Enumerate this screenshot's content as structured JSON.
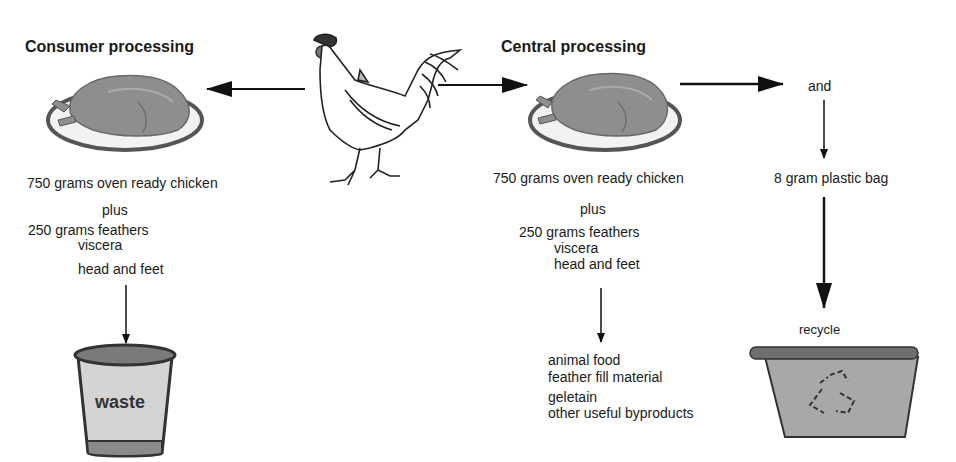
{
  "diagram": {
    "consumer": {
      "title": "Consumer processing",
      "product": "750 grams oven ready chicken",
      "plus": "plus",
      "byproducts": [
        "250 grams feathers",
        "viscera",
        "head and feet"
      ],
      "destination": "waste"
    },
    "central": {
      "title": "Central processing",
      "product": "750 grams oven ready chicken",
      "plus": "plus",
      "byproducts": [
        "250 grams feathers",
        "viscera",
        "head and feet"
      ],
      "uses": [
        "animal food",
        "feather fill material",
        "geletain",
        "other useful byproducts"
      ]
    },
    "packaging": {
      "and_label": "and",
      "bag": "8 gram plastic bag",
      "destination_label": "recycle"
    },
    "icons": {
      "source": "rooster-icon",
      "consumer_chicken": "roast-chicken-plate-icon",
      "central_chicken": "roast-chicken-plate-icon",
      "waste_bin": "waste-bucket-icon",
      "recycle_bin": "recycle-bin-icon"
    },
    "colors": {
      "line": "#111111",
      "chicken": "#8c8c8c",
      "plate_rim": "#6a6a6a",
      "bin_fill": "#a8a8a8",
      "bucket_fill": "#d0d0d0"
    }
  }
}
